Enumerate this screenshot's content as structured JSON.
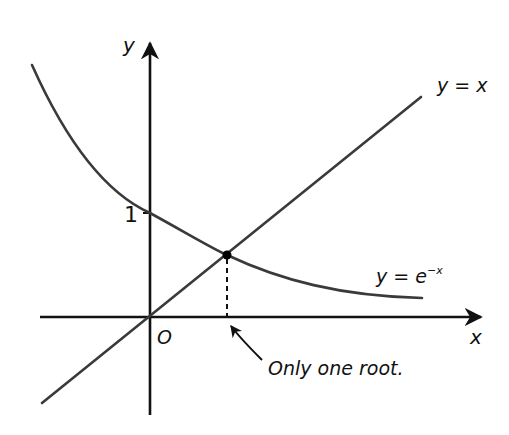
{
  "diagram": {
    "axes": {
      "x_label": "x",
      "y_label": "y",
      "origin_label": "O",
      "y_tick_label": "1"
    },
    "curves": [
      {
        "name": "exponential",
        "label_base": "y = e",
        "label_exp": "−x",
        "equation": "y = e^-x"
      },
      {
        "name": "identity-line",
        "label": "y = x",
        "equation": "y = x"
      }
    ],
    "annotation": {
      "text": "Only one root."
    },
    "colors": {
      "axes": "#111111",
      "curve": "#3a3a3a",
      "point": "#000000",
      "background": "#ffffff"
    }
  }
}
